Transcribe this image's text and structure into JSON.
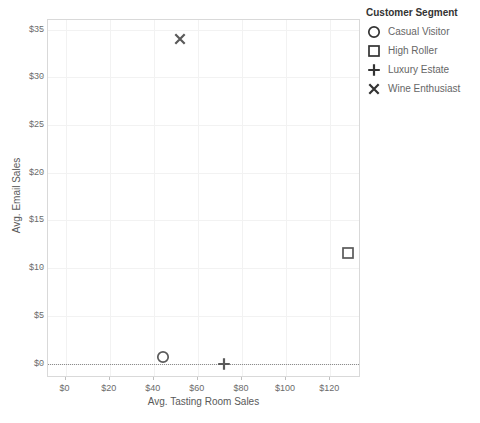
{
  "chart_data": {
    "type": "scatter",
    "title": "",
    "xlabel": "Avg. Tasting Room Sales",
    "ylabel": "Avg. Email Sales",
    "xlim": [
      -8,
      134
    ],
    "ylim": [
      -1.5,
      36.0
    ],
    "xticks": [
      0,
      20,
      40,
      60,
      80,
      100,
      120
    ],
    "xticklabels": [
      "$0",
      "$20",
      "$40",
      "$60",
      "$80",
      "$100",
      "$120"
    ],
    "yticks": [
      0,
      5,
      10,
      15,
      20,
      25,
      30,
      35
    ],
    "yticklabels": [
      "$0",
      "$5",
      "$10",
      "$15",
      "$20",
      "$25",
      "$30",
      "$35"
    ],
    "grid": true,
    "legend_position": "right",
    "reference_line": {
      "axis": "y",
      "value": 0,
      "style": "dotted"
    },
    "series": [
      {
        "name": "Casual Visitor",
        "marker": "circle",
        "x": [
          44.0
        ],
        "y": [
          0.7
        ]
      },
      {
        "name": "High Roller",
        "marker": "square",
        "x": [
          128.0
        ],
        "y": [
          11.6
        ]
      },
      {
        "name": "Luxury Estate",
        "marker": "plus",
        "x": [
          72.0
        ],
        "y": [
          0.0
        ]
      },
      {
        "name": "Wine Enthusiast",
        "marker": "cross",
        "x": [
          52.0
        ],
        "y": [
          34.0
        ]
      }
    ]
  },
  "legend": {
    "title": "Customer Segment",
    "items": [
      {
        "label": "Casual Visitor",
        "marker": "circle"
      },
      {
        "label": "High Roller",
        "marker": "square"
      },
      {
        "label": "Luxury Estate",
        "marker": "plus"
      },
      {
        "label": "Wine Enthusiast",
        "marker": "cross"
      }
    ]
  },
  "colors": {
    "marker": "#5a5a5a",
    "legend_marker": "#333333",
    "grid": "#f2f2f2",
    "frame": "#d9d9d9",
    "tick_text": "#6b6b6b",
    "axis_title": "#595959",
    "background": "#ffffff"
  }
}
